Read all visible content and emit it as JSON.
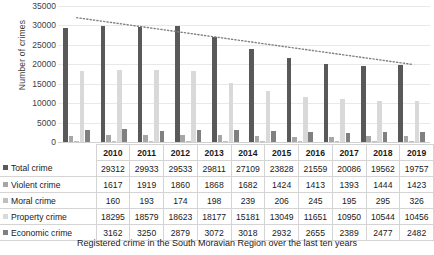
{
  "chart_data": {
    "type": "bar",
    "title": "",
    "xlabel": "",
    "ylabel": "Number of crimes",
    "ylim": [
      0,
      35000
    ],
    "yticks": [
      0,
      5000,
      10000,
      15000,
      20000,
      25000,
      30000,
      35000
    ],
    "grid": true,
    "legend_position": "table-left",
    "categories": [
      "2010",
      "2011",
      "2012",
      "2013",
      "2014",
      "2015",
      "2016",
      "2017",
      "2018",
      "2019"
    ],
    "series": [
      {
        "name": "Total crime",
        "color": "#595959",
        "values": [
          29312,
          29933,
          29533,
          29811,
          27109,
          23828,
          21559,
          20086,
          19562,
          19757
        ]
      },
      {
        "name": "Violent crime",
        "color": "#A6A6A6",
        "values": [
          1617,
          1919,
          1860,
          1868,
          1682,
          1424,
          1413,
          1393,
          1444,
          1423
        ]
      },
      {
        "name": "Moral crime",
        "color": "#BFBFBF",
        "values": [
          160,
          193,
          174,
          198,
          239,
          206,
          245,
          195,
          295,
          326
        ]
      },
      {
        "name": "Property crime",
        "color": "#D9D9D9",
        "values": [
          18295,
          18579,
          18623,
          18177,
          15181,
          13049,
          11651,
          10950,
          10544,
          10456
        ]
      },
      {
        "name": "Economic crime",
        "color": "#808080",
        "values": [
          3162,
          3250,
          2879,
          3072,
          3018,
          2932,
          2655,
          2389,
          2477,
          2482
        ]
      }
    ],
    "trendline": {
      "name": "Linear trend",
      "style": "dotted",
      "color": "#808080",
      "start_value": 32000,
      "end_value": 20000
    }
  },
  "caption": "Registered crime in the South Moravian Region over the last ten years"
}
